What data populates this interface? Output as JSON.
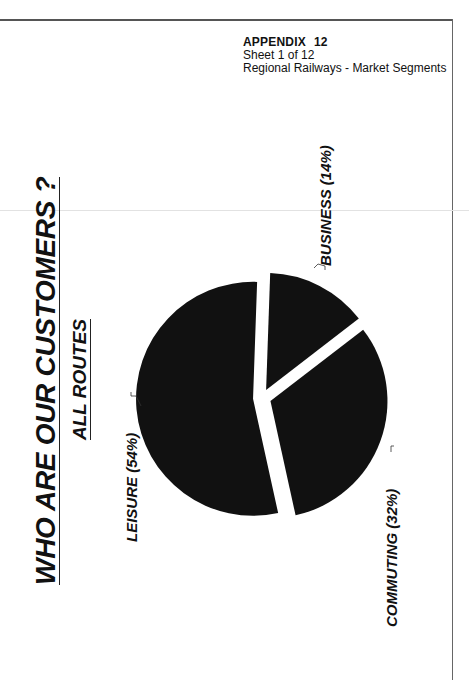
{
  "header": {
    "appendix_label": "APPENDIX",
    "appendix_number": "12",
    "sheet": "Sheet 1 of 12",
    "subject": "Regional Railways - Market Segments"
  },
  "title": "WHO ARE OUR CUSTOMERS ?",
  "subtitle": "ALL ROUTES",
  "chart_data": {
    "type": "pie",
    "title": "WHO ARE OUR CUSTOMERS ?",
    "subtitle": "ALL ROUTES",
    "categories": [
      "LEISURE",
      "BUSINESS",
      "COMMUTING"
    ],
    "values": [
      54,
      14,
      32
    ],
    "labels": [
      "LEISURE (54%)",
      "BUSINESS (14%)",
      "COMMUTING (32%)"
    ],
    "unit": "%",
    "exploded": true,
    "orientation": "rotated 90° counter-clockwise",
    "color": "#111111"
  }
}
